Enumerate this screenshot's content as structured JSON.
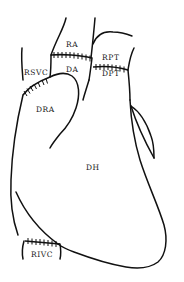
{
  "diagram": {
    "labels": {
      "ra": "RA",
      "da": "DA",
      "rpt": "RPT",
      "dpt": "DPT",
      "rsvc": "RSVC",
      "dra": "DRA",
      "dh": "DH",
      "rivc": "RIVC"
    },
    "suture_lines": [
      "aorta-anastomosis",
      "pulmonary-trunk-anastomosis",
      "superior-vena-cava-anastomosis",
      "inferior-vena-cava-anastomosis"
    ],
    "colors": {
      "stroke": "#111111",
      "background": "#ffffff",
      "text": "#1a1a1a"
    }
  }
}
